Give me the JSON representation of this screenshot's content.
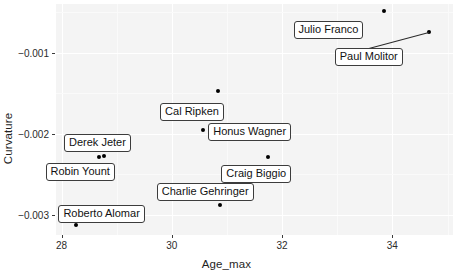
{
  "chart_data": {
    "type": "scatter",
    "title": "",
    "xlabel": "Age_max",
    "ylabel": "Curvature",
    "xlim": [
      27.9,
      35.1
    ],
    "ylim": [
      -0.00325,
      -0.0004
    ],
    "grid": true,
    "legend": "none",
    "xticks": [
      28,
      30,
      32,
      34
    ],
    "xtick_labels": [
      "28",
      "30",
      "32",
      "34"
    ],
    "yticks": [
      -0.001,
      -0.002,
      -0.003
    ],
    "ytick_labels": [
      "−0.001",
      "−0.002",
      "−0.003"
    ],
    "points": [
      {
        "label": "Julio Franco",
        "x": 33.84,
        "y": -0.00049
      },
      {
        "label": "Paul Molitor",
        "x": 34.66,
        "y": -0.00075
      },
      {
        "label": "Cal Ripken",
        "x": 30.84,
        "y": -0.00147
      },
      {
        "label": "Honus Wagner",
        "x": 30.57,
        "y": -0.00195
      },
      {
        "label": "Derek Jeter",
        "x": 28.77,
        "y": -0.00228
      },
      {
        "label": "Robin Yount",
        "x": 28.67,
        "y": -0.00229
      },
      {
        "label": "Craig Biggio",
        "x": 31.75,
        "y": -0.00229
      },
      {
        "label": "Charlie Gehringer",
        "x": 30.87,
        "y": -0.00288
      },
      {
        "label": "Roberto Alomar",
        "x": 28.27,
        "y": -0.00313
      }
    ],
    "annotations": [
      {
        "text": "Julio Franco",
        "for": "Julio Franco"
      },
      {
        "text": "Paul Molitor",
        "for": "Paul Molitor"
      },
      {
        "text": "Cal Ripken",
        "for": "Cal Ripken"
      },
      {
        "text": "Honus Wagner",
        "for": "Honus Wagner"
      },
      {
        "text": "Derek Jeter",
        "for": "Derek Jeter"
      },
      {
        "text": "Robin Yount",
        "for": "Robin Yount"
      },
      {
        "text": "Craig Biggio",
        "for": "Craig Biggio"
      },
      {
        "text": "Charlie Gehringer",
        "for": "Charlie Gehringer"
      },
      {
        "text": "Roberto Alomar",
        "for": "Roberto Alomar"
      }
    ],
    "colors": {
      "point": "#000000",
      "panel_background": "#f4f4f4",
      "gridline": "#ffffff",
      "label_border": "#3c3c3c",
      "label_background": "#ffffff",
      "text": "#1a1a1a"
    }
  },
  "axes": {
    "x_title": "Age_max",
    "y_title": "Curvature"
  },
  "labels": {
    "julio_franco": "Julio Franco",
    "paul_molitor": "Paul Molitor",
    "cal_ripken": "Cal Ripken",
    "honus_wagner": "Honus Wagner",
    "derek_jeter": "Derek Jeter",
    "robin_yount": "Robin Yount",
    "craig_biggio": "Craig Biggio",
    "charlie_gehringer": "Charlie Gehringer",
    "roberto_alomar": "Roberto Alomar"
  }
}
